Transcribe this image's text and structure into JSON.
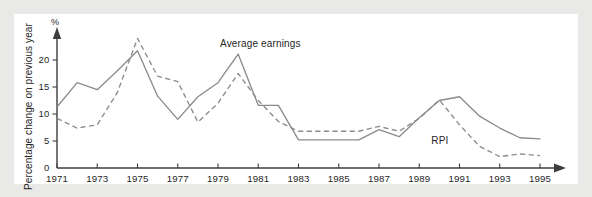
{
  "chart_data": {
    "type": "line",
    "title": "",
    "xlabel": "",
    "ylabel": "Percentage change on previous year",
    "yunit": "%",
    "xlim": [
      1971,
      1995
    ],
    "ylim": [
      0,
      25
    ],
    "yticks": [
      0,
      5,
      10,
      15,
      20
    ],
    "ytick_labels": [
      "0",
      "5",
      "10",
      "15",
      "20"
    ],
    "xticks": [
      1971,
      1973,
      1975,
      1977,
      1979,
      1981,
      1983,
      1985,
      1987,
      1989,
      1991,
      1993,
      1995
    ],
    "xtick_labels": [
      "1971",
      "1973",
      "1975",
      "1977",
      "1979",
      "1981",
      "1983",
      "1985",
      "1987",
      "1989",
      "1991",
      "1993",
      "1995"
    ],
    "grid": false,
    "legend_position": "inline-annotations",
    "x": [
      1971,
      1972,
      1973,
      1974,
      1975,
      1976,
      1977,
      1978,
      1979,
      1980,
      1981,
      1982,
      1983,
      1984,
      1985,
      1986,
      1987,
      1988,
      1989,
      1990,
      1991,
      1992,
      1993,
      1994,
      1995
    ],
    "series": [
      {
        "name": "Average earnings",
        "style": "solid",
        "color": "#8b8b8b",
        "values": [
          11.3,
          15.8,
          14.5,
          18.0,
          21.7,
          13.3,
          9.0,
          13.2,
          15.8,
          21.1,
          11.6,
          11.6,
          5.2,
          5.2,
          5.2,
          5.2,
          7.1,
          5.8,
          9.3,
          12.5,
          13.2,
          9.6,
          7.4,
          5.6,
          5.4
        ]
      },
      {
        "name": "RPI",
        "style": "dashed",
        "color": "#8b8b8b",
        "values": [
          9.2,
          7.4,
          8.0,
          14.0,
          24.0,
          17.0,
          16.0,
          8.5,
          12.0,
          17.5,
          12.5,
          8.6,
          6.8,
          6.8,
          6.8,
          6.8,
          7.7,
          6.8,
          9.2,
          12.6,
          8.0,
          4.0,
          2.1,
          2.6,
          2.3
        ]
      }
    ],
    "annotations": [
      {
        "text": "Average earnings",
        "x": 1979.1,
        "y": 22.4
      },
      {
        "text": "RPI",
        "x": 1989.6,
        "y": 4.4
      }
    ]
  },
  "colors": {
    "outer_background": "#e9e9e7",
    "plot_background": "#ffffff",
    "axis": "#3d3d3d",
    "series": "#8b8b8b",
    "text": "#262626"
  }
}
